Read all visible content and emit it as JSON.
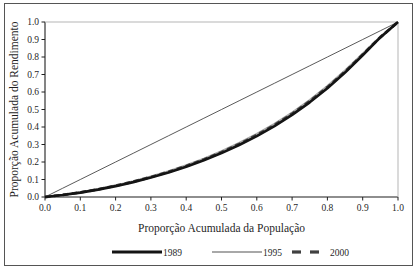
{
  "chart_data": {
    "type": "line",
    "title": "",
    "xlabel": "Proporção Acumulada da População",
    "ylabel": "Proporção Acumulada do Rendimento",
    "xlim": [
      0.0,
      1.0
    ],
    "ylim": [
      0.0,
      1.0
    ],
    "grid": false,
    "legend_position": "bottom",
    "xticks": [
      "0.0",
      "0.1",
      "0.2",
      "0.3",
      "0.4",
      "0.5",
      "0.6",
      "0.7",
      "0.8",
      "0.9",
      "1.0"
    ],
    "yticks": [
      "0.0",
      "0.1",
      "0.2",
      "0.3",
      "0.4",
      "0.5",
      "0.6",
      "0.7",
      "0.8",
      "0.9",
      "1.0"
    ],
    "x": [
      0.0,
      0.05,
      0.1,
      0.15,
      0.2,
      0.25,
      0.3,
      0.35,
      0.4,
      0.45,
      0.5,
      0.55,
      0.6,
      0.65,
      0.7,
      0.75,
      0.8,
      0.85,
      0.9,
      0.95,
      1.0
    ],
    "series": [
      {
        "name": "1989",
        "color": "#141414",
        "style": "solid",
        "width": 2.6,
        "values": [
          0.0,
          0.011,
          0.025,
          0.042,
          0.062,
          0.085,
          0.111,
          0.14,
          0.173,
          0.21,
          0.251,
          0.297,
          0.348,
          0.405,
          0.469,
          0.541,
          0.621,
          0.711,
          0.81,
          0.912,
          1.0
        ]
      },
      {
        "name": "1995",
        "color": "#a8a8a8",
        "style": "solid",
        "width": 2.2,
        "values": [
          0.0,
          0.012,
          0.027,
          0.045,
          0.066,
          0.09,
          0.117,
          0.147,
          0.181,
          0.219,
          0.261,
          0.308,
          0.36,
          0.418,
          0.482,
          0.554,
          0.634,
          0.722,
          0.818,
          0.915,
          1.0
        ]
      },
      {
        "name": "2000",
        "color": "#404040",
        "style": "dashed",
        "width": 2.8,
        "values": [
          0.0,
          0.0115,
          0.026,
          0.0435,
          0.064,
          0.0875,
          0.114,
          0.1435,
          0.177,
          0.2145,
          0.256,
          0.3025,
          0.354,
          0.4115,
          0.4755,
          0.5475,
          0.6275,
          0.7165,
          0.814,
          0.9135,
          1.0
        ]
      },
      {
        "name": "linha-de-igualdade",
        "color": "#303030",
        "style": "solid",
        "width": 0.8,
        "values": [
          0.0,
          0.05,
          0.1,
          0.15,
          0.2,
          0.25,
          0.3,
          0.35,
          0.4,
          0.45,
          0.5,
          0.55,
          0.6,
          0.65,
          0.7,
          0.75,
          0.8,
          0.85,
          0.9,
          0.95,
          1.0
        ]
      }
    ],
    "legend": [
      {
        "label": "1989",
        "color": "#141414",
        "style": "solid"
      },
      {
        "label": "1995",
        "color": "#a8a8a8",
        "style": "solid"
      },
      {
        "label": "2000",
        "color": "#404040",
        "style": "dashed"
      }
    ]
  },
  "axes": {
    "x_title": "Proporção Acumulada da População",
    "y_title": "Proporção Acumulada do Rendimento"
  },
  "colors": {
    "frame": "#555555",
    "axis": "#1f1f1f",
    "series_1989": "#141414",
    "series_1995": "#a8a8a8",
    "series_2000": "#404040",
    "equality_line": "#303030"
  }
}
